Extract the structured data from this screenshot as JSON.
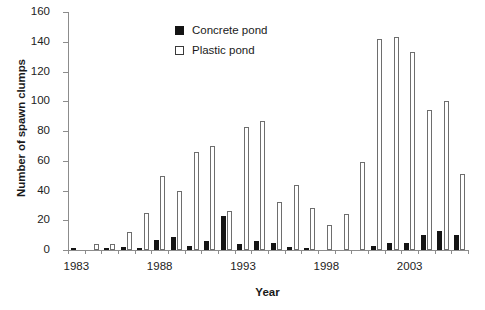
{
  "chart_data": {
    "type": "bar",
    "title": "",
    "xlabel": "Year",
    "ylabel": "Number of spawn clumps",
    "ylim": [
      0,
      160
    ],
    "ytick_step": 20,
    "yticks": [
      0,
      20,
      40,
      60,
      80,
      100,
      120,
      140,
      160
    ],
    "grid": false,
    "legend_position": "top-center",
    "xtick_labels": [
      "1983",
      "1988",
      "1993",
      "1998",
      "2003"
    ],
    "categories": [
      "1983",
      "1984",
      "1985",
      "1986",
      "1987",
      "1988",
      "1989",
      "1990",
      "1991",
      "1992",
      "1993",
      "1994",
      "1995",
      "1996",
      "1997",
      "1998",
      "1999",
      "2000",
      "2001",
      "2002",
      "2003",
      "2004",
      "2005",
      "2006"
    ],
    "series": [
      {
        "name": "Concrete pond",
        "color": "#141414",
        "values": [
          1,
          0,
          1,
          2,
          1,
          7,
          9,
          3,
          6,
          23,
          4,
          6,
          5,
          2,
          1,
          0,
          0,
          0,
          3,
          5,
          5,
          10,
          13,
          10
        ]
      },
      {
        "name": "Plastic pond",
        "color": "#ffffff",
        "values": [
          0,
          4,
          4,
          12,
          25,
          50,
          40,
          66,
          70,
          26,
          83,
          87,
          32,
          44,
          28,
          17,
          24,
          59,
          142,
          143,
          133,
          94,
          100,
          51
        ]
      }
    ]
  },
  "legend": {
    "items": [
      {
        "label": "Concrete pond",
        "swatch": "filled-square"
      },
      {
        "label": "Plastic pond",
        "swatch": "open-square"
      }
    ]
  },
  "axes": {
    "y_title": "Number of spawn clumps",
    "x_title": "Year"
  }
}
